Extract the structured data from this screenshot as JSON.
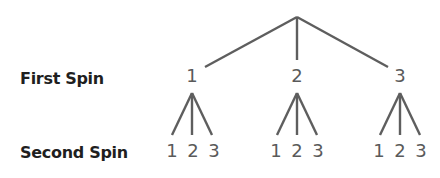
{
  "diagram": {
    "type": "tree",
    "row_labels": {
      "first": "First Spin",
      "second": "Second Spin"
    },
    "root": {
      "x": 297,
      "y": 17
    },
    "first_spin": [
      {
        "label": "1",
        "x": 192
      },
      {
        "label": "2",
        "x": 297
      },
      {
        "label": "3",
        "x": 400
      }
    ],
    "second_spin": [
      {
        "parent": "1",
        "labels": [
          "1",
          "2",
          "3"
        ]
      },
      {
        "parent": "2",
        "labels": [
          "1",
          "2",
          "3"
        ]
      },
      {
        "parent": "3",
        "labels": [
          "1",
          "2",
          "3"
        ]
      }
    ],
    "line_color": "#5e5e5e",
    "label_color": "#1f1f1f",
    "node_color": "#5a5a5a"
  }
}
